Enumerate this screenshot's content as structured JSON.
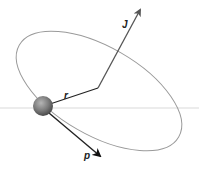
{
  "diagram": {
    "labels": {
      "angular_momentum": "J",
      "position": "r",
      "momentum": "p"
    },
    "colors": {
      "orbit": "#8a8a8a",
      "axis": "#c8c8c8",
      "vectors": "#222222",
      "j_vector": "#555555",
      "particle": "#777777"
    }
  }
}
